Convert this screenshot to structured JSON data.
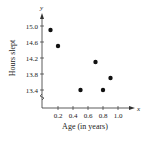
{
  "chart_data": {
    "type": "scatter",
    "title": "",
    "xlabel": "Age (in years)",
    "ylabel": "Hours slept",
    "x_axis_symbol": "x",
    "y_axis_symbol": "y",
    "x_ticks": [
      "0.2",
      "0.4",
      "0.6",
      "0.8",
      "1.0"
    ],
    "y_ticks": [
      "13.4",
      "13.8",
      "14.2",
      "14.6",
      "15.0"
    ],
    "xlim": [
      0,
      1.1
    ],
    "ylim": [
      13.4,
      15.0
    ],
    "y_axis_break": true,
    "grid": false,
    "legend": null,
    "points": [
      {
        "x": 0.1,
        "y": 14.9
      },
      {
        "x": 0.2,
        "y": 14.5
      },
      {
        "x": 0.5,
        "y": 13.4
      },
      {
        "x": 0.7,
        "y": 14.1
      },
      {
        "x": 0.8,
        "y": 13.4
      },
      {
        "x": 0.9,
        "y": 13.7
      }
    ],
    "colors": {
      "points": "#111111",
      "axes": "#333333"
    }
  }
}
